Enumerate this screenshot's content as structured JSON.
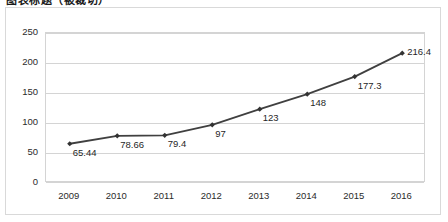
{
  "title": {
    "text": "图表标题（被裁切）",
    "visible_fragment": true
  },
  "chart_data": {
    "type": "line",
    "title": "",
    "xlabel": "",
    "ylabel": "",
    "categories": [
      "2009",
      "2010",
      "2011",
      "2012",
      "2013",
      "2014",
      "2015",
      "2016"
    ],
    "values": [
      65.44,
      78.66,
      79.4,
      97,
      123,
      148,
      177.3,
      216.4
    ],
    "data_labels": [
      "65.44",
      "78.66",
      "79.4",
      "97",
      "123",
      "148",
      "177.3",
      "216.4"
    ],
    "ylim": [
      0,
      250
    ],
    "yticks": [
      0,
      50,
      100,
      150,
      200,
      250
    ],
    "ytick_labels": [
      "0",
      "50",
      "100",
      "150",
      "200",
      "250"
    ],
    "grid": "horizontal",
    "legend": "none",
    "series": [
      {
        "name": "",
        "values": [
          65.44,
          78.66,
          79.4,
          97,
          123,
          148,
          177.3,
          216.4
        ],
        "line_color": "#404040",
        "marker": "diamond",
        "marker_color": "#333333"
      }
    ],
    "colors": {
      "line": "#404040",
      "marker": "#333333",
      "gridline": "#d4d4d4",
      "plot_border": "#d4d4d4",
      "frame_border": "#d9d9d9",
      "axis_text": "#2b2b2b",
      "label_text": "#1f1f1f",
      "background": "#ffffff"
    }
  }
}
